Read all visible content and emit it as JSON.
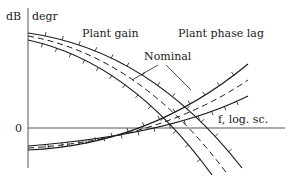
{
  "chart_data": {
    "type": "line",
    "title": "",
    "y_axis_labels": [
      "dB",
      "degr"
    ],
    "x_axis_label": "f, log. sc.",
    "zero_label": "0",
    "annotations": {
      "plant_gain": "Plant gain",
      "plant_phase_lag": "Plant phase lag",
      "nominal": "Nominal"
    },
    "series": [
      {
        "name": "Plant gain (upper bound)",
        "style": "solid",
        "ticks": true
      },
      {
        "name": "Plant gain (nominal)",
        "style": "dashed",
        "ticks": false
      },
      {
        "name": "Plant gain (lower bound)",
        "style": "solid",
        "ticks": true
      },
      {
        "name": "Plant phase lag (upper bound)",
        "style": "solid",
        "ticks": true
      },
      {
        "name": "Plant phase lag (nominal)",
        "style": "dashed",
        "ticks": false
      },
      {
        "name": "Plant phase lag (lower bound)",
        "style": "solid",
        "ticks": true
      }
    ],
    "x_scale": "log",
    "grid": false
  },
  "colors": {
    "ink": "#1a1a1a",
    "axis": "#555555"
  }
}
